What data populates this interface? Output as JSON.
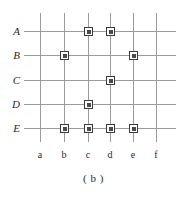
{
  "figure": {
    "caption": "( b )",
    "row_labels": [
      "A",
      "B",
      "C",
      "D",
      "E"
    ],
    "column_labels": [
      "a",
      "b",
      "c",
      "d",
      "e",
      "f"
    ],
    "colors": {
      "grid_line": "#9b9b9b",
      "marker_border": "#3a3a3a",
      "marker_fill": "#4a4a4a",
      "text": "#2b2b2b",
      "background": "#ffffff"
    }
  },
  "chart_data": {
    "type": "scatter",
    "title": "( b )",
    "xlabel": "",
    "ylabel": "",
    "x_categories": [
      "a",
      "b",
      "c",
      "d",
      "e",
      "f"
    ],
    "y_categories": [
      "A",
      "B",
      "C",
      "D",
      "E"
    ],
    "grid": true,
    "legend": "none",
    "marker_shape": "square",
    "points": [
      {
        "row": "A",
        "col": "c"
      },
      {
        "row": "A",
        "col": "d"
      },
      {
        "row": "B",
        "col": "b"
      },
      {
        "row": "B",
        "col": "e"
      },
      {
        "row": "C",
        "col": "d"
      },
      {
        "row": "D",
        "col": "c"
      },
      {
        "row": "E",
        "col": "b"
      },
      {
        "row": "E",
        "col": "c"
      },
      {
        "row": "E",
        "col": "d"
      },
      {
        "row": "E",
        "col": "e"
      }
    ],
    "geometry": {
      "col_x": {
        "a": 40,
        "b": 64,
        "c": 88,
        "d": 110,
        "e": 133,
        "f": 156
      },
      "row_y": {
        "A": 31,
        "B": 55,
        "C": 80,
        "D": 104,
        "E": 128
      },
      "v_line_top": 13,
      "v_line_bottom": 142,
      "h_line_left": 24,
      "h_line_right": 176,
      "col_label_y": 150
    }
  }
}
